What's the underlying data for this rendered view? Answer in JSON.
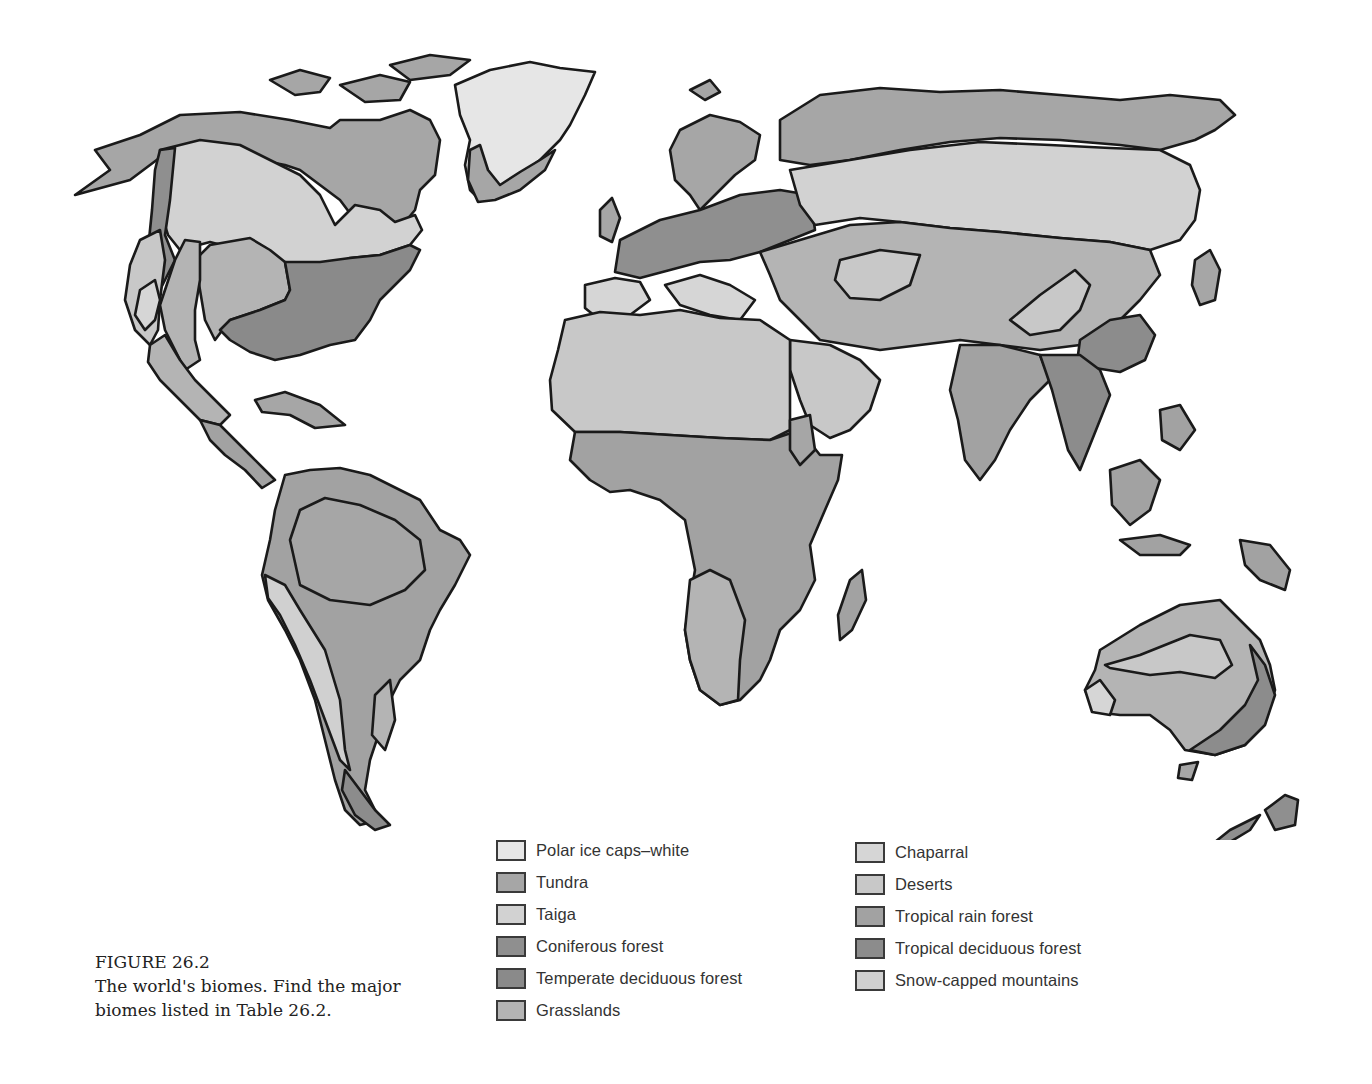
{
  "caption": {
    "figure_label": "FIGURE 26.2",
    "description": "The world's biomes. Find the major biomes listed in Table 26.2."
  },
  "legend": {
    "left": [
      {
        "label": "Polar ice caps–white",
        "color": "#e6e6e6"
      },
      {
        "label": "Tundra",
        "color": "#a6a6a6"
      },
      {
        "label": "Taiga",
        "color": "#d2d2d2"
      },
      {
        "label": "Coniferous forest",
        "color": "#8f8f8f"
      },
      {
        "label": "Temperate deciduous forest",
        "color": "#8a8a8a"
      },
      {
        "label": "Grasslands",
        "color": "#b4b4b4"
      }
    ],
    "right": [
      {
        "label": "Chaparral",
        "color": "#d6d6d6"
      },
      {
        "label": "Deserts",
        "color": "#c8c8c8"
      },
      {
        "label": "Tropical rain forest",
        "color": "#a2a2a2"
      },
      {
        "label": "Tropical deciduous forest",
        "color": "#8c8c8c"
      },
      {
        "label": "Snow-capped mountains",
        "color": "#d0d0d0"
      }
    ]
  },
  "map": {
    "regions": [
      "North America",
      "Greenland",
      "South America",
      "Europe",
      "Asia",
      "Africa",
      "Madagascar",
      "Australia",
      "New Zealand",
      "Japan",
      "Indonesia"
    ]
  }
}
